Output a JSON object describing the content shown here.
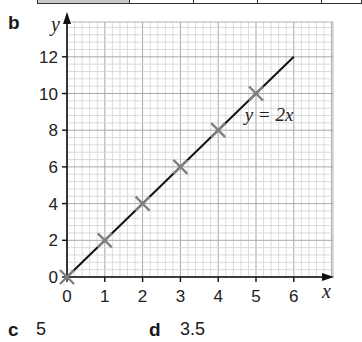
{
  "table_strip": {
    "cells": [
      {
        "x": 0,
        "w": 92,
        "fill": "#c8c8c8"
      },
      {
        "x": 92,
        "w": 64,
        "fill": "#ffffff"
      },
      {
        "x": 156,
        "w": 64,
        "fill": "#ffffff"
      },
      {
        "x": 220,
        "w": 64,
        "fill": "#ffffff"
      },
      {
        "x": 284,
        "w": 40,
        "fill": "#ffffff"
      }
    ]
  },
  "parts": {
    "b": {
      "label": "b"
    },
    "c": {
      "label": "c",
      "answer": "5"
    },
    "d": {
      "label": "d",
      "answer": "3.5"
    }
  },
  "chart_data": {
    "type": "line",
    "title": "",
    "xlabel": "x",
    "ylabel": "y",
    "xlim": [
      0,
      7
    ],
    "ylim": [
      0,
      14
    ],
    "grid": true,
    "x_ticks": [
      0,
      1,
      2,
      3,
      4,
      5,
      6
    ],
    "y_ticks": [
      0,
      2,
      4,
      6,
      8,
      10,
      12
    ],
    "series": [
      {
        "name": "y = 2x",
        "x": [
          0,
          1,
          2,
          3,
          4,
          5,
          6
        ],
        "y": [
          0,
          2,
          4,
          6,
          8,
          10,
          12
        ],
        "line_from": [
          0,
          0
        ],
        "line_to": [
          6,
          12
        ],
        "markers_x": [
          0,
          1,
          2,
          3,
          4,
          5
        ],
        "markers_y": [
          0,
          2,
          4,
          6,
          8,
          10
        ],
        "marker": "x",
        "line_color": "#111111",
        "marker_color": "#808080"
      }
    ],
    "annotations": [
      {
        "text": "y = 2x",
        "x": 4.7,
        "y": 8.5
      }
    ],
    "legend": "none"
  }
}
